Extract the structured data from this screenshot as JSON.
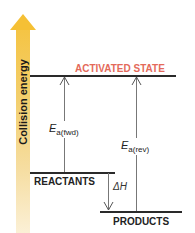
{
  "diagram": {
    "axis": {
      "label": "Collision energy",
      "direction": "up",
      "gradient_top": "#f5c443",
      "gradient_bottom": "#fbf0d6"
    },
    "levels": {
      "activated_state": {
        "label": "ACTIVATED STATE",
        "color": "#e46a5a"
      },
      "reactants": {
        "label": "REACTANTS"
      },
      "products": {
        "label": "PRODUCTS"
      }
    },
    "arrows": {
      "ea_fwd": {
        "symbol": "E",
        "subscript": "a(fwd)",
        "direction": "up"
      },
      "ea_rev": {
        "symbol": "E",
        "subscript": "a(rev)",
        "direction": "up"
      },
      "delta_h": {
        "symbol": "ΔH",
        "direction": "down"
      }
    }
  }
}
